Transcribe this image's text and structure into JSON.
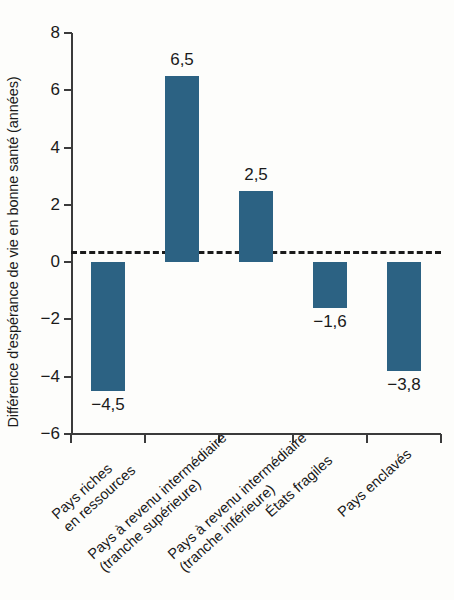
{
  "chart_data": {
    "type": "bar",
    "title": "",
    "subtitle": "",
    "xlabel": "",
    "ylabel": "Différence d'espérance de vie en bonne santé (années)",
    "categories": [
      "Pays riches\nen ressources",
      "Pays à revenu intermédiaire\n(tranche supérieure)",
      "Pays à revenu intermédiaire\n(tranche inférieure)",
      "États fragiles",
      "Pays enclavés"
    ],
    "values": [
      -4.5,
      6.5,
      2.5,
      -1.6,
      -3.8
    ],
    "value_labels": [
      "−4,5",
      "6,5",
      "2,5",
      "−1,6",
      "−3,8"
    ],
    "ylim": [
      -6,
      8
    ],
    "yticks": [
      8,
      6,
      4,
      2,
      0,
      -2,
      -4,
      -6
    ],
    "ytick_labels": [
      "8",
      "6",
      "4",
      "2",
      "0",
      "−2",
      "−4",
      "−6"
    ],
    "grid": false,
    "legend": null,
    "zero_line": true,
    "bar_color": "#2c6283",
    "axis_color": "#3b3b3b",
    "text_color": "#1a1a1a",
    "background_color": "#fdfdfb"
  }
}
